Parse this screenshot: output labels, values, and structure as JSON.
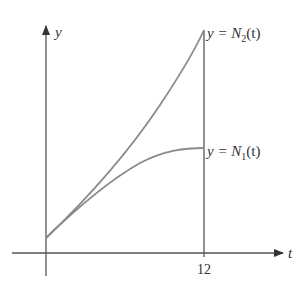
{
  "figure": {
    "axes": {
      "x_label": "t",
      "y_label": "y",
      "x_ticks": [
        "12"
      ]
    },
    "curves": [
      {
        "name": "N2",
        "label_prefix": "y = N",
        "subscript": "2",
        "label_suffix": "(t)",
        "shape": "concave up"
      },
      {
        "name": "N1",
        "label_prefix": "y = N",
        "subscript": "1",
        "label_suffix": "(t)",
        "shape": "concave down"
      }
    ],
    "colors": {
      "axes": "#555555",
      "curves": "#8a8a8a",
      "text": "#333333"
    }
  }
}
